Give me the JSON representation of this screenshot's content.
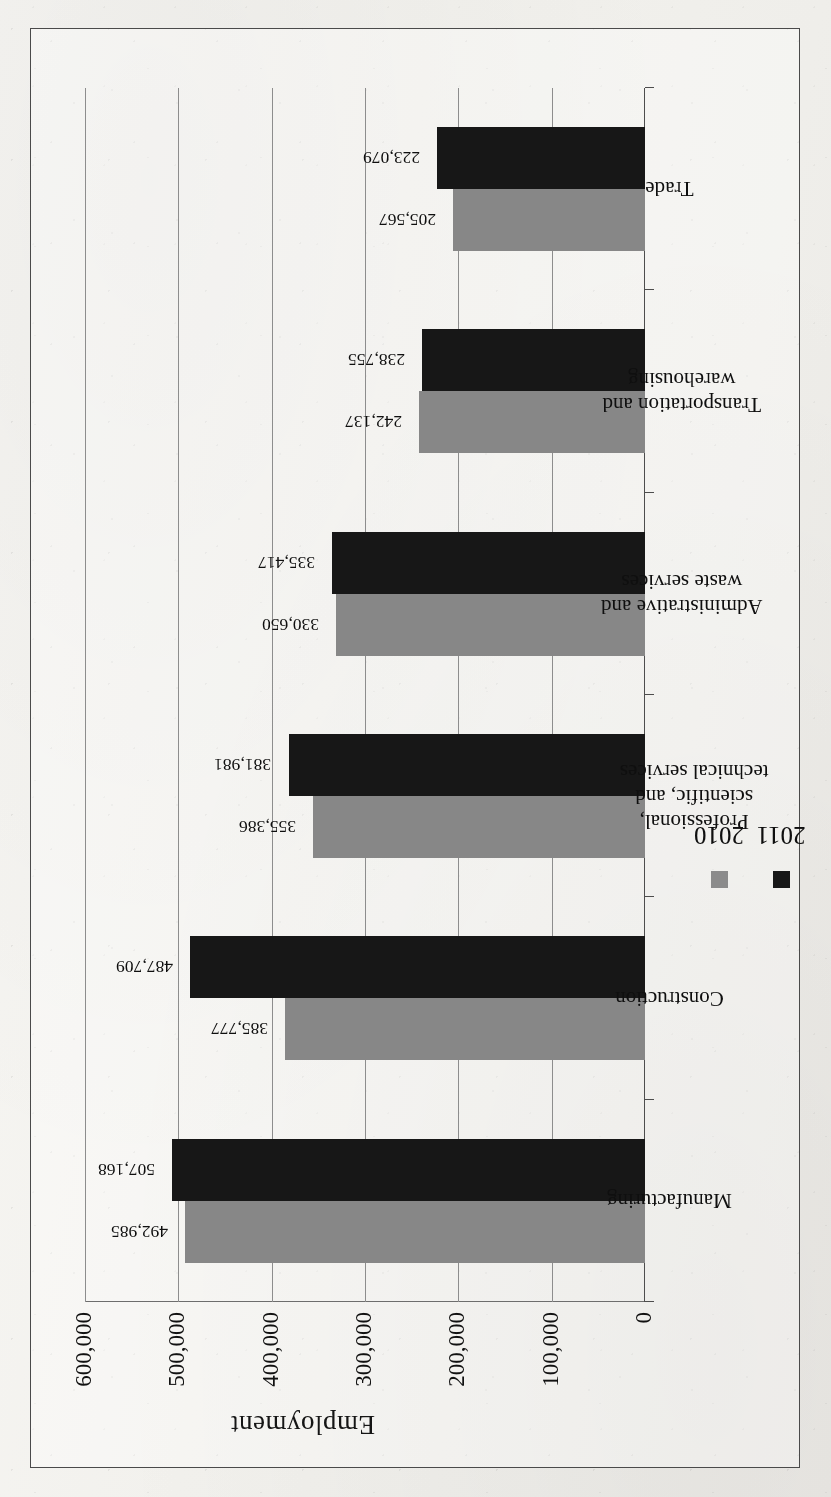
{
  "chart_data": {
    "type": "bar",
    "title": "",
    "xlabel": "",
    "ylabel": "Employment",
    "ylim": [
      0,
      600000
    ],
    "ytick_labels": [
      "600,000",
      "500,000",
      "400,000",
      "300,000",
      "200,000",
      "100,000",
      "0"
    ],
    "ytick_values": [
      600000,
      500000,
      400000,
      300000,
      200000,
      100000,
      0
    ],
    "grid": true,
    "legend_position": "bottom-right",
    "orientation": "page-rotated-90-ccw",
    "categories": [
      "Manufacturing",
      "Construction",
      "Professional, scientific, and technical services",
      "Administrative and waste services",
      "Transportation and warehousing",
      "Trade"
    ],
    "category_lines": [
      [
        "Manufacturing"
      ],
      [
        "Construction"
      ],
      [
        "Professional,",
        "scientific, and",
        "technical services"
      ],
      [
        "Administrative and",
        "waste services"
      ],
      [
        "Transportation and",
        "warehousing"
      ],
      [
        "Trade"
      ]
    ],
    "series": [
      {
        "name": "2010",
        "color": "#878787",
        "values": [
          492985,
          385777,
          355386,
          330650,
          242137,
          205567
        ],
        "labels": [
          "492,985",
          "385,777",
          "355,386",
          "330,650",
          "242,137",
          "205,567"
        ]
      },
      {
        "name": "2011",
        "color": "#1c1c1c",
        "values": [
          507168,
          487709,
          381981,
          335417,
          238755,
          223079
        ],
        "labels": [
          "507,168",
          "487,709",
          "381,981",
          "335,417",
          "238,755",
          "223,079"
        ]
      }
    ]
  },
  "legend": {
    "items": [
      {
        "label": "2010",
        "swatch": "legend-swatch-2010"
      },
      {
        "label": "2011",
        "swatch": "legend-swatch-2011"
      }
    ]
  },
  "axis": {
    "y_title": "Employment"
  }
}
